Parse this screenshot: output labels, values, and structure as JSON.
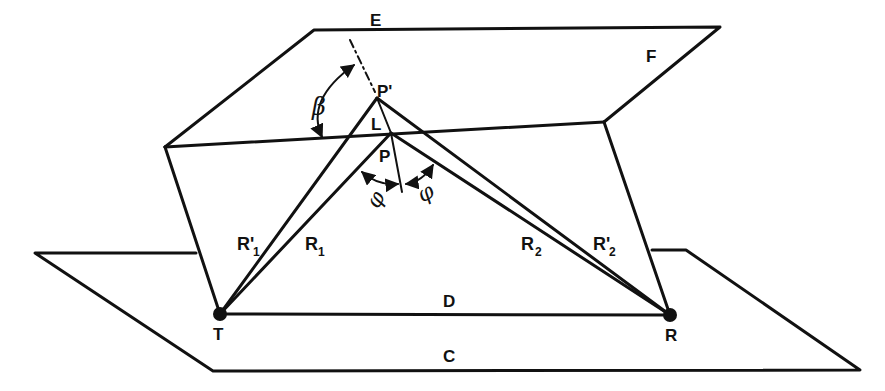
{
  "diagram": {
    "type": "reflection-geometry",
    "colors": {
      "ink": "#111111",
      "background": "#ffffff"
    },
    "planes": {
      "upper": {
        "label": "F"
      },
      "ground": {
        "label": "C"
      }
    },
    "points": {
      "transmitter": {
        "label": "T"
      },
      "receiver": {
        "label": "R"
      },
      "reflection_point": {
        "label": "P"
      },
      "image_point": {
        "label": "P'"
      },
      "direction": {
        "label": "E"
      },
      "segment": {
        "label": "L"
      }
    },
    "paths": {
      "r1": {
        "label": "R",
        "sub": "1"
      },
      "r1_prime": {
        "label": "R'",
        "sub": "1"
      },
      "r2": {
        "label": "R",
        "sub": "2"
      },
      "r2_prime": {
        "label": "R'",
        "sub": "2"
      },
      "direct": {
        "label": "D"
      }
    },
    "angles": {
      "beta": {
        "label": "β"
      },
      "phi_left": {
        "label": "φ"
      },
      "phi_right": {
        "label": "φ"
      }
    }
  }
}
